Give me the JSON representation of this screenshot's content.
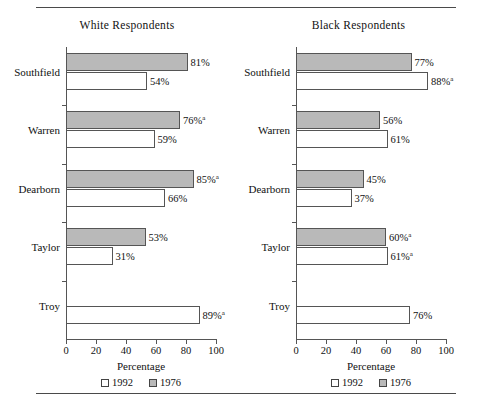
{
  "chart_data": {
    "type": "bar",
    "orientation": "horizontal",
    "title": "",
    "xlabel": "Percentage",
    "ylabel": "",
    "xlim": [
      0,
      100
    ],
    "xticks": [
      0,
      20,
      40,
      60,
      80,
      100
    ],
    "grid": false,
    "legend": {
      "position": "bottom-center",
      "entries": [
        {
          "name": "1992",
          "swatch": "white"
        },
        {
          "name": "1976",
          "swatch": "gray"
        }
      ]
    },
    "footnote_marker": "a",
    "panels": [
      {
        "title": "White Respondents",
        "categories": [
          "Southfield",
          "Warren",
          "Dearborn",
          "Taylor",
          "Troy"
        ],
        "series": [
          {
            "name": "1976",
            "swatch": "gray",
            "values": [
              81,
              76,
              85,
              53,
              null
            ],
            "labels": [
              "81%",
              "76%",
              "85%",
              "53%",
              ""
            ],
            "marks": [
              "",
              "a",
              "a",
              "",
              ""
            ]
          },
          {
            "name": "1992",
            "swatch": "white",
            "values": [
              54,
              59,
              66,
              31,
              89
            ],
            "labels": [
              "54%",
              "59%",
              "66%",
              "31%",
              "89%"
            ],
            "marks": [
              "",
              "",
              "",
              "",
              "a"
            ]
          }
        ]
      },
      {
        "title": "Black Respondents",
        "categories": [
          "Southfield",
          "Warren",
          "Dearborn",
          "Taylor",
          "Troy"
        ],
        "series": [
          {
            "name": "1976",
            "swatch": "gray",
            "values": [
              77,
              56,
              45,
              60,
              null
            ],
            "labels": [
              "77%",
              "56%",
              "45%",
              "60%",
              ""
            ],
            "marks": [
              "",
              "",
              "",
              "a",
              ""
            ]
          },
          {
            "name": "1992",
            "swatch": "white",
            "values": [
              88,
              61,
              37,
              61,
              76
            ],
            "labels": [
              "88%",
              "61%",
              "37%",
              "61%",
              "76%"
            ],
            "marks": [
              "a",
              "",
              "",
              "a",
              ""
            ]
          }
        ]
      }
    ]
  },
  "colors": {
    "bar_1976_fill": "#b9b9b9",
    "bar_1992_fill": "#ffffff",
    "bar_stroke": "#555555",
    "axis": "#555555",
    "rule": "#4a4a4a",
    "text": "#111111"
  }
}
